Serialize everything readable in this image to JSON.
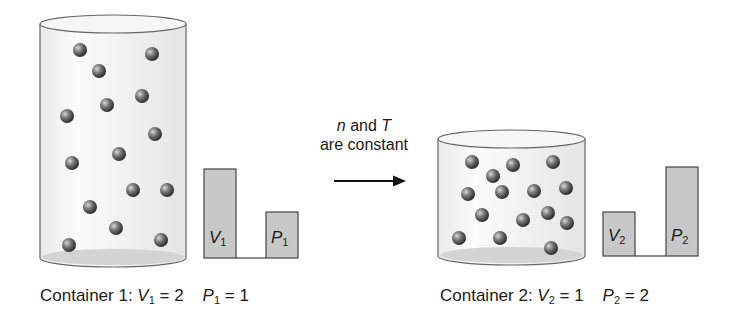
{
  "process": {
    "line1_var": "n",
    "line1_rest": " and ",
    "line1_var2": "T",
    "line2": "are constant"
  },
  "container1": {
    "caption_prefix": "Container 1: ",
    "v_symbol": "V",
    "v_sub": "1",
    "v_eq": " = 2",
    "p_symbol": "P",
    "p_sub": "1",
    "p_eq": " = 1",
    "bar_v_label": "V",
    "bar_v_sub": "1",
    "bar_p_label": "P",
    "bar_p_sub": "1",
    "volume": 2,
    "pressure": 1,
    "particle_count": 15
  },
  "container2": {
    "caption_prefix": "Container 2: ",
    "v_symbol": "V",
    "v_sub": "2",
    "v_eq": " = 1",
    "p_symbol": "P",
    "p_sub": "2",
    "p_eq": " = 2",
    "bar_v_label": "V",
    "bar_v_sub": "2",
    "bar_p_label": "P",
    "bar_p_sub": "2",
    "volume": 1,
    "pressure": 2,
    "particle_count": 15
  },
  "colors": {
    "bar_fill": "#c8c8c8",
    "bar_stroke": "#444444",
    "container_fill": "#f2f2f2",
    "container_stroke": "#666666",
    "particle": "#555555"
  }
}
